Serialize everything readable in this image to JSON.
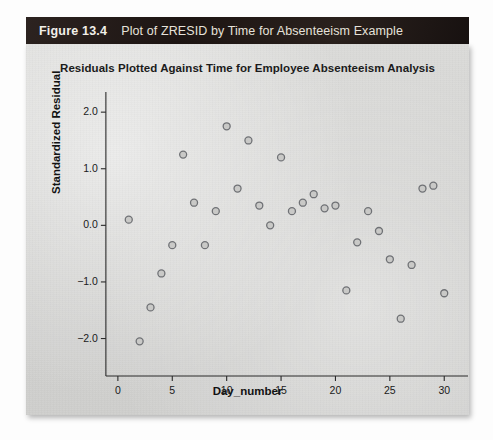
{
  "caption": {
    "figure_number": "Figure 13.4",
    "figure_title": "Plot of ZRESID by Time for Absenteeism Example"
  },
  "chart_data": {
    "type": "scatter",
    "title": "Residuals Plotted Against Time for Employee Absenteeism Analysis",
    "xlabel": "Day_number",
    "ylabel": "Standardized Residual",
    "xlim": [
      -1,
      32
    ],
    "ylim": [
      -2.45,
      2.25
    ],
    "xticks": [
      0,
      5,
      10,
      15,
      20,
      25,
      30
    ],
    "xtick_labels": [
      "0",
      "5",
      "10",
      "15",
      "20",
      "25",
      "30"
    ],
    "yticks": [
      2.0,
      1.0,
      0.0,
      -1.0,
      -2.0
    ],
    "ytick_labels": [
      "2.0",
      "1.0",
      "0.0",
      "-1.0",
      "-2.0"
    ],
    "grid": false,
    "legend": null,
    "marker": "open-circle",
    "marker_color": "#6f7175",
    "marker_fill": "#c9c9c7",
    "x": [
      1,
      2,
      3,
      4,
      5,
      6,
      7,
      8,
      9,
      10,
      11,
      12,
      13,
      14,
      15,
      16,
      17,
      18,
      19,
      20,
      21,
      22,
      23,
      24,
      25,
      26,
      27,
      28,
      29,
      30
    ],
    "y": [
      0.1,
      -2.05,
      -1.45,
      -0.85,
      -0.35,
      1.25,
      0.4,
      -0.35,
      0.25,
      1.75,
      0.65,
      1.5,
      0.35,
      0.0,
      1.2,
      0.25,
      0.4,
      0.55,
      0.3,
      0.35,
      -1.15,
      -0.3,
      0.25,
      -0.1,
      -0.6,
      -1.65,
      -0.7,
      0.65,
      0.7,
      -1.2
    ]
  },
  "colors": {
    "caption_bar": "#231a17",
    "panel_background": "#d4d4d2",
    "axis": "#2a2a2a",
    "text": "#121212"
  }
}
